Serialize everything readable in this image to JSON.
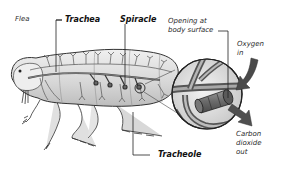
{
  "diagram": {
    "labels": {
      "flea": "Flea",
      "trachea": "Trachea",
      "spiracle": "Spiracle",
      "opening": "Opening at\nbody surface",
      "oxygen": "Oxygen\nin",
      "carbon": "Carbon\ndioxide\nout",
      "tracheole": "Tracheole"
    },
    "colors": {
      "outline": "#333333",
      "body_fill": "#d4d4d4",
      "body_light": "#ebebeb",
      "trachea_tube": "#6a6a6a",
      "arrow": "#4a4a4a",
      "leader_line": "#222222",
      "background": "#ffffff"
    }
  }
}
